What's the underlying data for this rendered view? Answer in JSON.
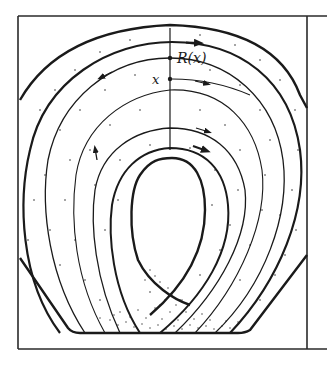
{
  "figure": {
    "labels": {
      "return_point": "R(x)",
      "start_point": "x"
    },
    "colors": {
      "ink": "#1a1a1a",
      "frame": "#2a2a2a",
      "background": "#ffffff",
      "stipple": "#333333"
    }
  }
}
